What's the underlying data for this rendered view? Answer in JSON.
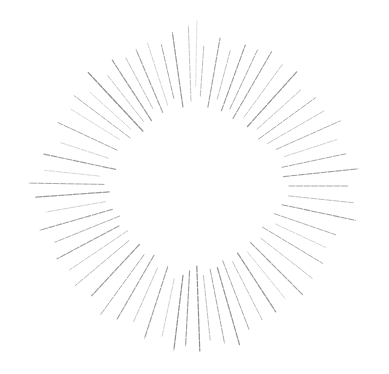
{
  "graphic": {
    "name": "starburst",
    "background": "#ffffff",
    "center": [
      194,
      186
    ],
    "rays": [
      {
        "a": -92,
        "r1": 85,
        "r2": 160,
        "w": 0.9,
        "c": "#bdbdbd"
      },
      {
        "a": -98,
        "r1": 80,
        "r2": 155,
        "w": 1.2,
        "c": "#9a9a9a"
      },
      {
        "a": -103,
        "r1": 90,
        "r2": 145,
        "w": 1.0,
        "c": "#a8a8a8"
      },
      {
        "a": -108,
        "r1": 85,
        "r2": 150,
        "w": 0.8,
        "c": "#c6c6c6"
      },
      {
        "a": -113,
        "r1": 80,
        "r2": 148,
        "w": 1.1,
        "c": "#a0a0a0"
      },
      {
        "a": -118,
        "r1": 88,
        "r2": 145,
        "w": 0.9,
        "c": "#b5b5b5"
      },
      {
        "a": -123,
        "r1": 78,
        "r2": 150,
        "w": 1.2,
        "c": "#9a9a9a"
      },
      {
        "a": -128,
        "r1": 82,
        "r2": 140,
        "w": 0.9,
        "c": "#bbbbbb"
      },
      {
        "a": -133,
        "r1": 75,
        "r2": 155,
        "w": 1.3,
        "c": "#8e8e8e"
      },
      {
        "a": -138,
        "r1": 85,
        "r2": 140,
        "w": 0.8,
        "c": "#c8c8c8"
      },
      {
        "a": -143,
        "r1": 80,
        "r2": 150,
        "w": 1.0,
        "c": "#b0b0b0"
      },
      {
        "a": -148,
        "r1": 88,
        "r2": 145,
        "w": 0.8,
        "c": "#cccccc"
      },
      {
        "a": -155,
        "r1": 85,
        "r2": 150,
        "w": 1.0,
        "c": "#a8a8a8"
      },
      {
        "a": -162,
        "r1": 90,
        "r2": 140,
        "w": 0.8,
        "c": "#c8c8c8"
      },
      {
        "a": -168,
        "r1": 80,
        "r2": 155,
        "w": 1.1,
        "c": "#a0a0a0"
      },
      {
        "a": -174,
        "r1": 95,
        "r2": 150,
        "w": 0.8,
        "c": "#cccccc"
      },
      {
        "a": -179,
        "r1": 90,
        "r2": 165,
        "w": 1.0,
        "c": "#a8a8a8"
      },
      {
        "a": 176,
        "r1": 85,
        "r2": 160,
        "w": 1.2,
        "c": "#9a9a9a"
      },
      {
        "a": 170,
        "r1": 90,
        "r2": 150,
        "w": 0.8,
        "c": "#c4c4c4"
      },
      {
        "a": 164,
        "r1": 85,
        "r2": 160,
        "w": 1.1,
        "c": "#a2a2a2"
      },
      {
        "a": 158,
        "r1": 80,
        "r2": 150,
        "w": 1.0,
        "c": "#b0b0b0"
      },
      {
        "a": 152,
        "r1": 85,
        "r2": 155,
        "w": 1.1,
        "c": "#a0a0a0"
      },
      {
        "a": 146,
        "r1": 80,
        "r2": 150,
        "w": 0.9,
        "c": "#bdbdbd"
      },
      {
        "a": 140,
        "r1": 85,
        "r2": 155,
        "w": 1.0,
        "c": "#b5b5b5"
      },
      {
        "a": 133,
        "r1": 80,
        "r2": 150,
        "w": 1.2,
        "c": "#9a9a9a"
      },
      {
        "a": 126,
        "r1": 85,
        "r2": 160,
        "w": 1.0,
        "c": "#a8a8a8"
      },
      {
        "a": 120,
        "r1": 80,
        "r2": 155,
        "w": 1.1,
        "c": "#a0a0a0"
      },
      {
        "a": 114,
        "r1": 90,
        "r2": 150,
        "w": 0.9,
        "c": "#bdbdbd"
      },
      {
        "a": 108,
        "r1": 85,
        "r2": 160,
        "w": 1.1,
        "c": "#9e9e9e"
      },
      {
        "a": 102,
        "r1": 95,
        "r2": 155,
        "w": 0.8,
        "c": "#c4c4c4"
      },
      {
        "a": 97,
        "r1": 90,
        "r2": 165,
        "w": 1.2,
        "c": "#909090"
      },
      {
        "a": 93,
        "r1": 85,
        "r2": 160,
        "w": 1.1,
        "c": "#9a9a9a"
      },
      {
        "a": 88,
        "r1": 80,
        "r2": 165,
        "w": 1.2,
        "c": "#8e8e8e"
      },
      {
        "a": 84,
        "r1": 90,
        "r2": 155,
        "w": 0.9,
        "c": "#b8b8b8"
      },
      {
        "a": 79,
        "r1": 85,
        "r2": 160,
        "w": 1.0,
        "c": "#a8a8a8"
      },
      {
        "a": 74,
        "r1": 85,
        "r2": 165,
        "w": 1.2,
        "c": "#959595"
      },
      {
        "a": 69,
        "r1": 80,
        "r2": 155,
        "w": 1.0,
        "c": "#a8a8a8"
      },
      {
        "a": 63,
        "r1": 85,
        "r2": 150,
        "w": 0.9,
        "c": "#b8b8b8"
      },
      {
        "a": 57,
        "r1": 80,
        "r2": 150,
        "w": 1.2,
        "c": "#959595"
      },
      {
        "a": 51,
        "r1": 85,
        "r2": 145,
        "w": 0.8,
        "c": "#c6c6c6"
      },
      {
        "a": 45,
        "r1": 80,
        "r2": 155,
        "w": 1.1,
        "c": "#a0a0a0"
      },
      {
        "a": 38,
        "r1": 85,
        "r2": 150,
        "w": 0.9,
        "c": "#bbbbbb"
      },
      {
        "a": 31,
        "r1": 80,
        "r2": 150,
        "w": 1.0,
        "c": "#aaaaaa"
      },
      {
        "a": 25,
        "r1": 90,
        "r2": 145,
        "w": 0.8,
        "c": "#c6c6c6"
      },
      {
        "a": 19,
        "r1": 85,
        "r2": 150,
        "w": 1.0,
        "c": "#b0b0b0"
      },
      {
        "a": 12,
        "r1": 90,
        "r2": 165,
        "w": 1.1,
        "c": "#a0a0a0"
      },
      {
        "a": 6,
        "r1": 95,
        "r2": 160,
        "w": 0.9,
        "c": "#b8b8b8"
      },
      {
        "a": 0,
        "r1": 95,
        "r2": 155,
        "w": 1.0,
        "c": "#aaaaaa"
      },
      {
        "a": -6,
        "r1": 90,
        "r2": 165,
        "w": 1.1,
        "c": "#a0a0a0"
      },
      {
        "a": -12,
        "r1": 90,
        "r2": 155,
        "w": 1.0,
        "c": "#aaaaaa"
      },
      {
        "a": -18,
        "r1": 95,
        "r2": 150,
        "w": 0.8,
        "c": "#c4c4c4"
      },
      {
        "a": -24,
        "r1": 90,
        "r2": 160,
        "w": 1.0,
        "c": "#b0b0b0"
      },
      {
        "a": -30,
        "r1": 85,
        "r2": 150,
        "w": 0.9,
        "c": "#bdbdbd"
      },
      {
        "a": -36,
        "r1": 80,
        "r2": 150,
        "w": 1.0,
        "c": "#a8a8a8"
      },
      {
        "a": -42,
        "r1": 85,
        "r2": 145,
        "w": 0.9,
        "c": "#b8b8b8"
      },
      {
        "a": -48,
        "r1": 80,
        "r2": 155,
        "w": 1.2,
        "c": "#959595"
      },
      {
        "a": -54,
        "r1": 85,
        "r2": 150,
        "w": 0.9,
        "c": "#bdbdbd"
      },
      {
        "a": -60,
        "r1": 78,
        "r2": 155,
        "w": 1.1,
        "c": "#9e9e9e"
      },
      {
        "a": -65,
        "r1": 85,
        "r2": 150,
        "w": 1.0,
        "c": "#a8a8a8"
      },
      {
        "a": -70,
        "r1": 80,
        "r2": 150,
        "w": 1.1,
        "c": "#9a9a9a"
      },
      {
        "a": -75,
        "r1": 90,
        "r2": 140,
        "w": 0.9,
        "c": "#b8b8b8"
      },
      {
        "a": -80,
        "r1": 80,
        "r2": 150,
        "w": 1.1,
        "c": "#a0a0a0"
      },
      {
        "a": -86,
        "r1": 90,
        "r2": 140,
        "w": 0.9,
        "c": "#b5b5b5"
      },
      {
        "a": -89,
        "r1": 100,
        "r2": 165,
        "w": 0.7,
        "c": "#d0d0d0"
      }
    ]
  }
}
